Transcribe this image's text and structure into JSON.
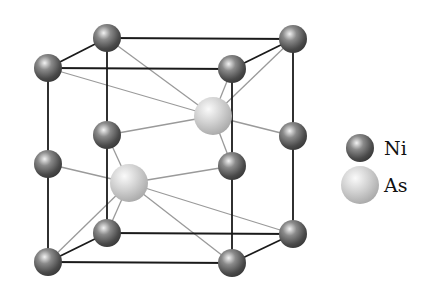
{
  "diagram": {
    "type": "crystal-structure",
    "colors": {
      "ni": "#555555",
      "as": "#c8c8c8",
      "edge": "#1a1a1a",
      "bond": "#9a9a9a",
      "background": "#ffffff"
    },
    "atoms": [
      {
        "id": "ni-btl",
        "species": "Ni",
        "x": 107,
        "y": 38
      },
      {
        "id": "ni-btr",
        "species": "Ni",
        "x": 293,
        "y": 39
      },
      {
        "id": "ni-ftl",
        "species": "Ni",
        "x": 48,
        "y": 68
      },
      {
        "id": "ni-ftr",
        "species": "Ni",
        "x": 232,
        "y": 69
      },
      {
        "id": "ni-bml",
        "species": "Ni",
        "x": 107,
        "y": 135
      },
      {
        "id": "ni-bmr",
        "species": "Ni",
        "x": 293,
        "y": 136
      },
      {
        "id": "ni-fml",
        "species": "Ni",
        "x": 48,
        "y": 164
      },
      {
        "id": "ni-fmr",
        "species": "Ni",
        "x": 232,
        "y": 166
      },
      {
        "id": "ni-bbl",
        "species": "Ni",
        "x": 107,
        "y": 233
      },
      {
        "id": "ni-bbr",
        "species": "Ni",
        "x": 293,
        "y": 234
      },
      {
        "id": "ni-fbl",
        "species": "Ni",
        "x": 48,
        "y": 262
      },
      {
        "id": "ni-fbr",
        "species": "Ni",
        "x": 232,
        "y": 263
      },
      {
        "id": "as-upper",
        "species": "As",
        "x": 213,
        "y": 116
      },
      {
        "id": "as-lower",
        "species": "As",
        "x": 129,
        "y": 183
      }
    ],
    "legend": [
      {
        "species": "Ni",
        "label": "Ni",
        "x": 360,
        "y": 148
      },
      {
        "species": "As",
        "label": "As",
        "x": 360,
        "y": 185
      }
    ]
  }
}
